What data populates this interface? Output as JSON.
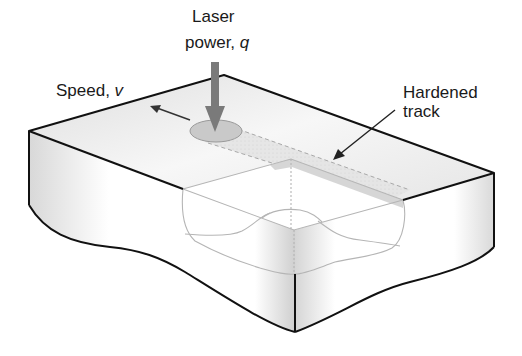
{
  "diagram": {
    "labels": {
      "laser_line1": "Laser",
      "laser_line2_text": "power, ",
      "laser_symbol": "q",
      "speed_text": "Speed, ",
      "speed_symbol": "v",
      "track_line1": "Hardened",
      "track_line2": "track"
    },
    "colors": {
      "outline": "#111111",
      "laser_arrow": "#7a7a7a",
      "spot_fill": "#c9c9c9",
      "track_fill": "#e6e6e6",
      "hardened_shade": "#cfcfcf",
      "cutaway_line": "#b5b5b5",
      "face_shadow": "#bdbdbd"
    }
  }
}
